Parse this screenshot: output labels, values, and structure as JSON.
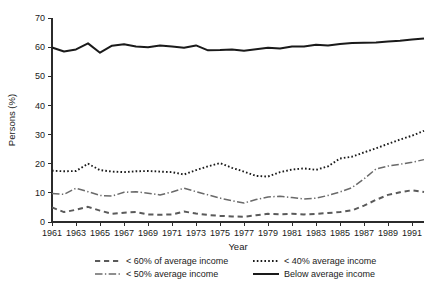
{
  "chart_data": {
    "type": "line",
    "title": "",
    "xlabel": "Year",
    "ylabel": "Persons (%)",
    "xlim": [
      1961,
      1992
    ],
    "ylim": [
      0,
      70
    ],
    "ytick_labels": [
      "0",
      "10",
      "20",
      "30",
      "40",
      "50",
      "60",
      "70"
    ],
    "ytick_values": [
      0,
      10,
      20,
      30,
      40,
      50,
      60,
      70
    ],
    "xtick_labels": [
      "1961",
      "1963",
      "1965",
      "1967",
      "1969",
      "1971",
      "1973",
      "1975",
      "1977",
      "1979",
      "1981",
      "1983",
      "1985",
      "1987",
      "1989",
      "1991"
    ],
    "xtick_values": [
      1961,
      1963,
      1965,
      1967,
      1969,
      1971,
      1973,
      1975,
      1977,
      1979,
      1981,
      1983,
      1985,
      1987,
      1989,
      1991
    ],
    "grid": false,
    "legend_position": "bottom",
    "x": [
      1961,
      1962,
      1963,
      1964,
      1965,
      1966,
      1967,
      1968,
      1969,
      1970,
      1971,
      1972,
      1973,
      1974,
      1975,
      1976,
      1977,
      1978,
      1979,
      1980,
      1981,
      1982,
      1983,
      1984,
      1985,
      1986,
      1987,
      1988,
      1989,
      1990,
      1991,
      1992
    ],
    "series": [
      {
        "name": "Below average income",
        "style": "solid",
        "color": "#1a1a1a",
        "width": 2.0,
        "values": [
          59.9,
          58.5,
          59.2,
          61.3,
          58.1,
          60.5,
          61.0,
          60.2,
          60.0,
          60.6,
          60.2,
          59.8,
          60.6,
          58.9,
          59.0,
          59.2,
          58.8,
          59.3,
          59.8,
          59.5,
          60.2,
          60.2,
          60.8,
          60.6,
          61.1,
          61.4,
          61.5,
          61.6,
          61.9,
          62.2,
          62.6,
          63.0
        ]
      },
      {
        "name": "< 40% average income",
        "style": "dotted",
        "color": "#1a1a1a",
        "width": 1.9,
        "values": [
          17.6,
          17.4,
          17.5,
          20.0,
          17.8,
          17.3,
          17.1,
          17.4,
          17.5,
          17.3,
          17.1,
          16.3,
          17.8,
          19.1,
          20.2,
          18.6,
          17.3,
          15.8,
          15.6,
          17.1,
          18.0,
          18.4,
          17.9,
          19.1,
          21.8,
          22.4,
          23.9,
          25.3,
          26.8,
          28.3,
          29.6,
          31.3
        ]
      },
      {
        "name": "< 50% average income",
        "style": "dashdot",
        "color": "#6a6a6a",
        "width": 1.5,
        "values": [
          9.8,
          9.5,
          11.6,
          10.4,
          9.1,
          8.9,
          10.2,
          10.4,
          9.9,
          9.3,
          10.3,
          11.6,
          10.4,
          9.3,
          8.2,
          7.3,
          6.5,
          7.7,
          8.6,
          8.8,
          8.4,
          7.9,
          8.2,
          9.1,
          10.3,
          11.8,
          14.8,
          18.2,
          19.2,
          19.8,
          20.5,
          21.4
        ]
      },
      {
        "name": "< 60% of average income",
        "style": "dashed",
        "color": "#5a5a5a",
        "width": 2.0,
        "values": [
          5.0,
          3.4,
          4.2,
          5.2,
          3.9,
          2.8,
          3.2,
          3.4,
          2.6,
          2.5,
          2.6,
          3.6,
          2.9,
          2.4,
          2.1,
          1.9,
          1.8,
          2.3,
          2.8,
          2.6,
          2.8,
          2.6,
          2.8,
          3.1,
          3.4,
          4.0,
          5.6,
          7.6,
          9.3,
          10.2,
          10.9,
          10.3
        ]
      }
    ]
  },
  "legend": {
    "entries": [
      {
        "label": "< 60% of average income",
        "style": "dashed"
      },
      {
        "label": "< 40% average income",
        "style": "dotted"
      },
      {
        "label": "< 50% average income",
        "style": "dashdot"
      },
      {
        "label": "Below average income",
        "style": "solid"
      }
    ]
  }
}
